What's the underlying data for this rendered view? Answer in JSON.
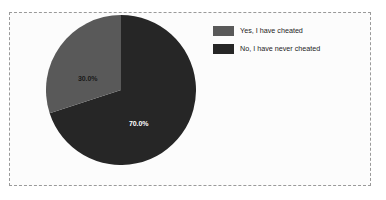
{
  "chart_data": {
    "type": "pie",
    "title": "",
    "categories": [
      "Yes, I have cheated",
      "No, I have never cheated"
    ],
    "values": [
      30.0,
      70.0
    ],
    "value_labels": [
      "30.0%",
      "70.0%"
    ],
    "colors": [
      "#595959",
      "#262626"
    ],
    "legend_position": "right",
    "grid": false,
    "start_angle_deg": 0,
    "direction": "clockwise",
    "slices": [
      {
        "label": "No, I have never cheated",
        "value": 70.0,
        "display": "70.0%",
        "color": "#262626",
        "label_color": "#ffffff"
      },
      {
        "label": "Yes, I have cheated",
        "value": 30.0,
        "display": "30.0%",
        "color": "#595959",
        "label_color": "#1a1a1a"
      }
    ]
  },
  "legend": {
    "items": [
      {
        "label": "Yes, I have cheated",
        "color": "#595959"
      },
      {
        "label": "No, I have never cheated",
        "color": "#262626"
      }
    ]
  },
  "frame": {
    "border_color": "#9a9a9a",
    "background": "#fcfcfc"
  }
}
